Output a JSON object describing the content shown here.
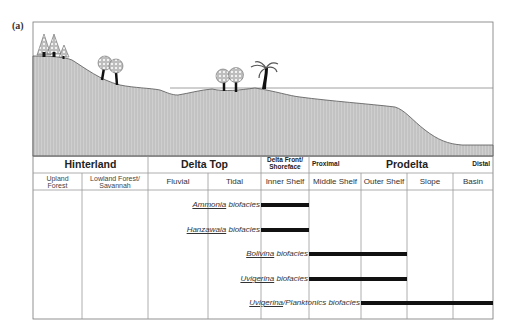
{
  "panel_label": "(a)",
  "zones": [
    {
      "label": "Hinterland",
      "size": "big"
    },
    {
      "label": "Delta Top",
      "size": "big"
    },
    {
      "label": "Delta Front/\nShoreface",
      "size": "small"
    },
    {
      "label": "Proximal",
      "size": "small"
    },
    {
      "label": "Prodelta",
      "size": "big"
    },
    {
      "label": "Distal",
      "size": "small"
    }
  ],
  "environments": [
    {
      "label": "Upland\nForest"
    },
    {
      "label": "Lowland Forest/\nSavannah"
    },
    {
      "label": "Fluvial"
    },
    {
      "label": "Tidal"
    },
    {
      "label": "Inner Shelf"
    },
    {
      "label": "Middle Shelf"
    },
    {
      "label": "Outer Shelf"
    },
    {
      "label": "Slope"
    },
    {
      "label": "Basin"
    }
  ],
  "biofacies": [
    {
      "genus": "Ammonia",
      "suffix": " biofacies",
      "from": "Inner Shelf",
      "to": "Inner Shelf"
    },
    {
      "genus": "Hanzawaia",
      "suffix": " biofacies",
      "from": "Inner Shelf",
      "to": "Inner Shelf"
    },
    {
      "genus": "Bolivina",
      "suffix": " biofacies",
      "from": "Middle Shelf",
      "to": "Outer Shelf"
    },
    {
      "genus": "Uvigerina",
      "suffix": " biofacies",
      "from": "Middle Shelf",
      "to": "Outer Shelf"
    },
    {
      "genus": "Uvigerina",
      "suffix": "/Planktonics biofacies",
      "from": "Outer Shelf",
      "to": "Basin"
    }
  ],
  "colors": {
    "terrain_fill": "#c9c9c9",
    "terrain_line": "#555555",
    "grid_line": "#9a9a9a",
    "bar": "#111111"
  }
}
